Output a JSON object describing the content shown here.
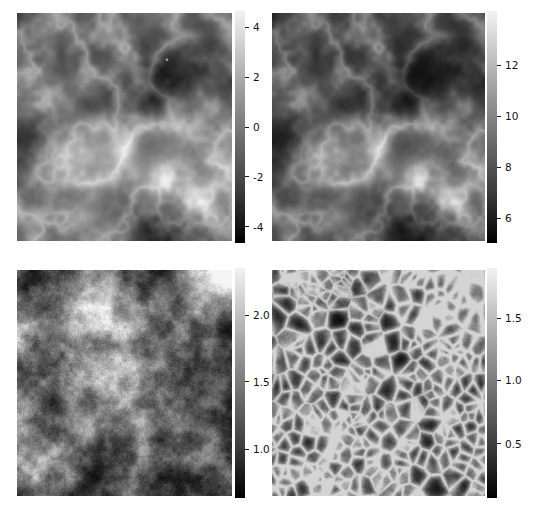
{
  "figure": {
    "width": 533,
    "height": 514,
    "background": "#ffffff",
    "layout": "2x2 grid of grayscale image panels, each with a vertical colorbar on its right",
    "colormap": "gray",
    "tick_color": "#111111"
  },
  "chart_data": [
    {
      "id": "panel-top-left",
      "type": "heatmap",
      "title": "",
      "xlabel": "",
      "ylabel": "",
      "grid": false,
      "colormap": "gray",
      "colorbar": {
        "position": "right",
        "orientation": "vertical",
        "ticks": [
          4,
          2,
          0,
          -2,
          -4
        ],
        "tick_labels": [
          "4",
          "2",
          "0",
          "-2",
          "-4"
        ],
        "vmin": -4.6,
        "vmax": 4.6
      },
      "image": {
        "rows": 128,
        "cols": 128,
        "value_min": -4.6,
        "value_max": 4.6,
        "description": "smooth large-scale cloud-like field with bright filament crossing the centre, dark patch at left-middle, bright blob lower right, single bright point source near upper centre"
      }
    },
    {
      "id": "panel-top-right",
      "type": "heatmap",
      "title": "",
      "xlabel": "",
      "ylabel": "",
      "grid": false,
      "colormap": "gray",
      "colorbar": {
        "position": "right",
        "orientation": "vertical",
        "ticks": [
          12,
          10,
          8,
          6
        ],
        "tick_labels": [
          "12",
          "10",
          "8",
          "6"
        ],
        "vmin": 4.6,
        "vmax": 13.8
      },
      "image": {
        "rows": 128,
        "cols": 128,
        "value_min": 4.6,
        "value_max": 13.8,
        "description": "same morphology as top-left but offset and rescaled; bright filament across centre, darker overall background"
      }
    },
    {
      "id": "panel-bottom-left",
      "type": "heatmap",
      "title": "",
      "xlabel": "",
      "ylabel": "",
      "grid": false,
      "colormap": "gray",
      "colorbar": {
        "position": "right",
        "orientation": "vertical",
        "ticks": [
          2.0,
          1.5,
          1.0
        ],
        "tick_labels": [
          "2.0",
          "1.5",
          "1.0"
        ],
        "vmin": 0.72,
        "vmax": 2.32
      },
      "image": {
        "rows": 128,
        "cols": 128,
        "value_min": 0.72,
        "value_max": 2.32,
        "description": "dark mottled field, fine grainy texture, bright glow in upper-right corner"
      }
    },
    {
      "id": "panel-bottom-right",
      "type": "heatmap",
      "title": "",
      "xlabel": "",
      "ylabel": "",
      "grid": false,
      "colormap": "gray",
      "colorbar": {
        "position": "right",
        "orientation": "vertical",
        "ticks": [
          1.5,
          1.0,
          0.5
        ],
        "tick_labels": [
          "1.5",
          "1.0",
          "0.5"
        ],
        "vmin": 0.2,
        "vmax": 1.85
      },
      "image": {
        "rows": 128,
        "cols": 128,
        "value_min": 0.2,
        "value_max": 1.85,
        "description": "dark field with strong cellular / web-like granular network texture, brighter toward upper-right"
      }
    }
  ],
  "panels": [
    {
      "name": "panel-top-left",
      "image_rect": {
        "x": 17,
        "y": 13,
        "w": 215,
        "h": 228
      },
      "colorbar_rect": {
        "x": 235,
        "y": 11,
        "w": 10,
        "h": 232
      },
      "ticks": [
        {
          "label": "4",
          "frac": 0.07
        },
        {
          "label": "2",
          "frac": 0.285
        },
        {
          "label": "0",
          "frac": 0.5
        },
        {
          "label": "-2",
          "frac": 0.715
        },
        {
          "label": "-4",
          "frac": 0.93
        }
      ]
    },
    {
      "name": "panel-top-right",
      "image_rect": {
        "x": 272,
        "y": 13,
        "w": 213,
        "h": 228
      },
      "colorbar_rect": {
        "x": 487,
        "y": 11,
        "w": 10,
        "h": 232
      },
      "ticks": [
        {
          "label": "12",
          "frac": 0.235
        },
        {
          "label": "10",
          "frac": 0.455
        },
        {
          "label": "8",
          "frac": 0.675
        },
        {
          "label": "6",
          "frac": 0.895
        }
      ]
    },
    {
      "name": "panel-bottom-left",
      "image_rect": {
        "x": 17,
        "y": 270,
        "w": 215,
        "h": 226
      },
      "colorbar_rect": {
        "x": 235,
        "y": 268,
        "w": 10,
        "h": 230
      },
      "ticks": [
        {
          "label": "2.0",
          "frac": 0.205
        },
        {
          "label": "1.5",
          "frac": 0.495
        },
        {
          "label": "1.0",
          "frac": 0.79
        }
      ]
    },
    {
      "name": "panel-bottom-right",
      "image_rect": {
        "x": 272,
        "y": 270,
        "w": 213,
        "h": 226
      },
      "colorbar_rect": {
        "x": 487,
        "y": 268,
        "w": 10,
        "h": 230
      },
      "ticks": [
        {
          "label": "1.5",
          "frac": 0.22
        },
        {
          "label": "1.0",
          "frac": 0.49
        },
        {
          "label": "0.5",
          "frac": 0.765
        }
      ]
    }
  ]
}
